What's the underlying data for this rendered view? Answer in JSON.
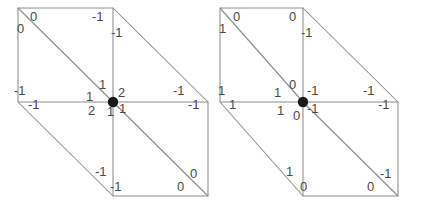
{
  "diagram": {
    "panel_count": 2,
    "line_color": "#8d8d8d",
    "label_color": "#4a4a4a",
    "dot_color": "#1a1a1a"
  },
  "figures": [
    {
      "id": "figure-left",
      "name": "left-diagram",
      "center_dot": {
        "x": 113,
        "y": 102
      },
      "labels": [
        {
          "id": "L-tl-upper",
          "text": "0",
          "x": 30,
          "y": 10
        },
        {
          "id": "L-tl-lower",
          "text": "0",
          "x": 17,
          "y": 22
        },
        {
          "id": "L-tm-left",
          "text": "-1",
          "x": 92,
          "y": 10
        },
        {
          "id": "L-tm-right",
          "text": "-1",
          "x": 111,
          "y": 26
        },
        {
          "id": "L-lm-upper",
          "text": "-1",
          "x": 14,
          "y": 84
        },
        {
          "id": "L-lm-lower",
          "text": "-1",
          "x": 28,
          "y": 98
        },
        {
          "id": "L-c-up",
          "text": "1",
          "x": 99,
          "y": 78
        },
        {
          "id": "L-c-left",
          "text": "1",
          "x": 86,
          "y": 90
        },
        {
          "id": "L-c-right",
          "text": "2",
          "x": 118,
          "y": 86
        },
        {
          "id": "L-c-dleft",
          "text": "2",
          "x": 88,
          "y": 104
        },
        {
          "id": "L-c-down",
          "text": "1",
          "x": 107,
          "y": 105
        },
        {
          "id": "L-c-dright",
          "text": "1",
          "x": 119,
          "y": 102
        },
        {
          "id": "L-rm-upper",
          "text": "-1",
          "x": 173,
          "y": 84
        },
        {
          "id": "L-rm-lower",
          "text": "-1",
          "x": 188,
          "y": 98
        },
        {
          "id": "L-bm-upper",
          "text": "-1",
          "x": 95,
          "y": 165
        },
        {
          "id": "L-bm-lower",
          "text": "-1",
          "x": 110,
          "y": 180
        },
        {
          "id": "L-br-left",
          "text": "0",
          "x": 177,
          "y": 180
        },
        {
          "id": "L-br-right",
          "text": "0",
          "x": 190,
          "y": 167
        }
      ]
    },
    {
      "id": "figure-right",
      "name": "right-diagram",
      "center_dot": {
        "x": 88,
        "y": 102
      },
      "labels": [
        {
          "id": "R-tl-left",
          "text": "1",
          "x": 4,
          "y": 22
        },
        {
          "id": "R-tl-right",
          "text": "0",
          "x": 18,
          "y": 10
        },
        {
          "id": "R-tm-left",
          "text": "0",
          "x": 74,
          "y": 10
        },
        {
          "id": "R-tm-right",
          "text": "-1",
          "x": 86,
          "y": 26
        },
        {
          "id": "R-lm-upper",
          "text": "1",
          "x": 3,
          "y": 84
        },
        {
          "id": "R-lm-lower",
          "text": "1",
          "x": 14,
          "y": 98
        },
        {
          "id": "R-c-up",
          "text": "0",
          "x": 74,
          "y": 78
        },
        {
          "id": "R-c-left",
          "text": "1",
          "x": 59,
          "y": 86
        },
        {
          "id": "R-c-right",
          "text": "-1",
          "x": 92,
          "y": 84
        },
        {
          "id": "R-c-dleft",
          "text": "1",
          "x": 62,
          "y": 104
        },
        {
          "id": "R-c-dright",
          "text": "-1",
          "x": 92,
          "y": 102
        },
        {
          "id": "R-c-down",
          "text": "0",
          "x": 78,
          "y": 109
        },
        {
          "id": "R-rm-upper",
          "text": "-1",
          "x": 148,
          "y": 84
        },
        {
          "id": "R-rm-lower",
          "text": "-1",
          "x": 163,
          "y": 98
        },
        {
          "id": "R-bm-upper",
          "text": "1",
          "x": 71,
          "y": 165
        },
        {
          "id": "R-bm-lower",
          "text": "0",
          "x": 85,
          "y": 180
        },
        {
          "id": "R-br-left",
          "text": "0",
          "x": 152,
          "y": 180
        },
        {
          "id": "R-br-right",
          "text": "-1",
          "x": 165,
          "y": 167
        }
      ]
    }
  ],
  "geometry": {
    "left": {
      "square_upper": {
        "x1": 18,
        "y1": 8,
        "x2": 113,
        "y2": 102
      },
      "square_lower": {
        "x1": 113,
        "y1": 102,
        "x2": 208,
        "y2": 196
      },
      "outer_upper_right": [
        [
          113,
          8
        ],
        [
          208,
          102
        ]
      ],
      "outer_lower_left": [
        [
          18,
          102
        ],
        [
          113,
          196
        ]
      ]
    },
    "right": {
      "square_upper": {
        "x1": 5,
        "y1": 8,
        "x2": 88,
        "y2": 102
      },
      "square_lower": {
        "x1": 88,
        "y1": 102,
        "x2": 183,
        "y2": 196
      },
      "outer_upper_right": [
        [
          88,
          8
        ],
        [
          183,
          102
        ]
      ],
      "outer_lower_left": [
        [
          5,
          102
        ],
        [
          88,
          196
        ]
      ]
    }
  }
}
